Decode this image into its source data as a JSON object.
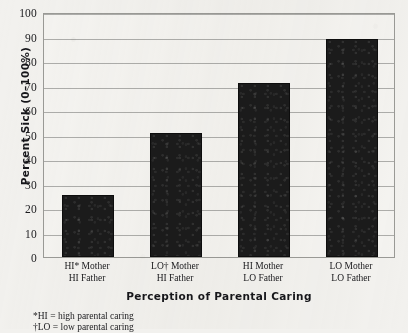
{
  "chart_data": {
    "type": "bar",
    "title": "",
    "categories": [
      "HI* Mother\nHI Father",
      "LO† Mother\nHI Father",
      "HI Mother\nLO Father",
      "LO Mother\nLO Father"
    ],
    "category_lines": [
      [
        "HI* Mother",
        "HI Father"
      ],
      [
        "LO† Mother",
        "HI Father"
      ],
      [
        "HI Mother",
        "LO Father"
      ],
      [
        "LO Mother",
        "LO Father"
      ]
    ],
    "values": [
      25.5,
      50.5,
      71,
      89
    ],
    "xlabel": "Perception of Parental Caring",
    "ylabel": "Percent Sick (0–100%)",
    "ylim": [
      0,
      100
    ],
    "ytick_labels": [
      "0",
      "10",
      "20",
      "30",
      "40",
      "50",
      "60",
      "70",
      "80",
      "90",
      "100"
    ],
    "ytick_values": [
      0,
      10,
      20,
      30,
      40,
      50,
      60,
      70,
      80,
      90,
      100
    ],
    "grid": true,
    "legend": "none",
    "bar_color": "#1b1b1b",
    "grid_color": "#adadaa",
    "background_color": "#f2f1ee",
    "text_color": "#19191c"
  },
  "footnotes": [
    "*HI = high parental caring",
    "†LO = low parental caring"
  ]
}
